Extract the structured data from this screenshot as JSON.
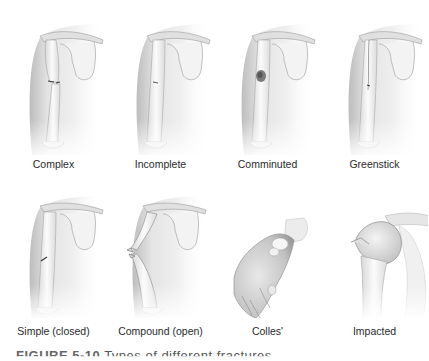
{
  "figure": {
    "caption_number": "FIGURE 5-10",
    "caption_text": "Types of different fractures",
    "panels": [
      {
        "label": "Complex",
        "type": "arm-complex"
      },
      {
        "label": "Incomplete",
        "type": "arm-incomplete"
      },
      {
        "label": "Comminuted",
        "type": "arm-comminuted"
      },
      {
        "label": "Greenstick",
        "type": "arm-greenstick"
      },
      {
        "label": "Simple (closed)",
        "type": "arm-simple"
      },
      {
        "label": "Compound (open)",
        "type": "arm-compound"
      },
      {
        "label": "Colles'",
        "type": "wrist-colles"
      },
      {
        "label": "Impacted",
        "type": "shoulder-impacted"
      }
    ]
  },
  "colors": {
    "skin_light": "#f2f2f2",
    "skin_mid": "#d6d6d6",
    "skin_dark": "#a8a8a8",
    "bone": "#fafafa",
    "outline": "#8c8c8c",
    "fracture": "#333333"
  }
}
